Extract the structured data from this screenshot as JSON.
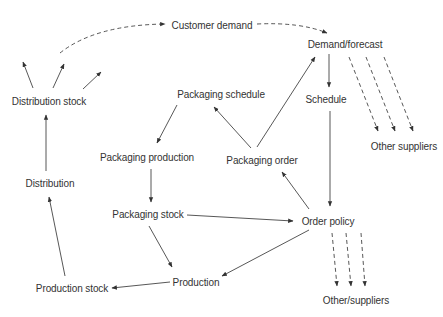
{
  "diagram": {
    "nodes": {
      "customer_demand": "Customer demand",
      "demand_forecast": "Demand/forecast",
      "schedule": "Schedule",
      "other_suppliers_top": "Other suppliers",
      "distribution_stock": "Distribution stock",
      "packaging_schedule": "Packaging schedule",
      "packaging_production": "Packaging production",
      "packaging_order": "Packaging order",
      "distribution": "Distribution",
      "packaging_stock": "Packaging stock",
      "order_policy": "Order policy",
      "production": "Production",
      "production_stock": "Production stock",
      "other_suppliers_bottom": "Other/suppliers"
    },
    "edges": [
      {
        "from": "Distribution stock",
        "to": "Customer demand",
        "style": "dashed"
      },
      {
        "from": "Customer demand",
        "to": "Demand/forecast",
        "style": "dashed"
      },
      {
        "from": "Demand/forecast",
        "to": "Schedule",
        "style": "solid"
      },
      {
        "from": "Demand/forecast",
        "to": "Other suppliers",
        "style": "dashed",
        "count": 3
      },
      {
        "from": "Schedule",
        "to": "Order policy",
        "style": "solid"
      },
      {
        "from": "Order policy",
        "to": "Other/suppliers",
        "style": "dashed",
        "count": 3
      },
      {
        "from": "Order policy",
        "to": "Packaging order",
        "style": "solid"
      },
      {
        "from": "Order policy",
        "to": "Production",
        "style": "solid"
      },
      {
        "from": "Packaging order",
        "to": "Packaging schedule",
        "style": "solid"
      },
      {
        "from": "Packaging order",
        "to": "Demand/forecast",
        "style": "solid"
      },
      {
        "from": "Packaging schedule",
        "to": "Packaging production",
        "style": "solid"
      },
      {
        "from": "Packaging production",
        "to": "Packaging stock",
        "style": "solid"
      },
      {
        "from": "Packaging stock",
        "to": "Order policy",
        "style": "solid"
      },
      {
        "from": "Packaging stock",
        "to": "Production",
        "style": "solid"
      },
      {
        "from": "Production",
        "to": "Production stock",
        "style": "solid"
      },
      {
        "from": "Production stock",
        "to": "Distribution",
        "style": "solid"
      },
      {
        "from": "Distribution",
        "to": "Distribution stock",
        "style": "solid"
      },
      {
        "from": "Distribution stock",
        "to": "(outflow)",
        "style": "solid",
        "count": 3
      }
    ]
  }
}
